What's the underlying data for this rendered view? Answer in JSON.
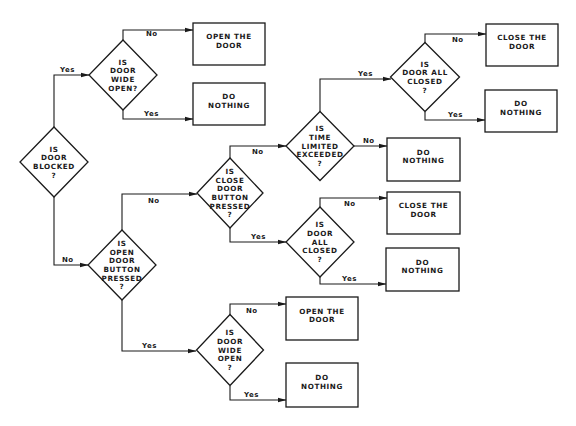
{
  "diagram": {
    "type": "flowchart",
    "colors": {
      "line": "#1a1a1a",
      "background": "#ffffff"
    },
    "nodes": [
      {
        "id": "d_blocked",
        "shape": "diamond",
        "cx": 54,
        "cy": 162,
        "w": 68,
        "h": 70,
        "lines": [
          "IS",
          "DOOR",
          "BLOCKED",
          "?"
        ]
      },
      {
        "id": "d_wide_open_1",
        "shape": "diamond",
        "cx": 123,
        "cy": 75,
        "w": 68,
        "h": 70,
        "lines": [
          "IS",
          "DOOR",
          "WIDE",
          "OPEN?"
        ]
      },
      {
        "id": "b_open_door_1",
        "shape": "box",
        "x": 193,
        "y": 23,
        "w": 72,
        "h": 42,
        "lines": [
          "OPEN THE",
          "DOOR"
        ]
      },
      {
        "id": "b_do_nothing_1",
        "shape": "box",
        "x": 193,
        "y": 83,
        "w": 72,
        "h": 42,
        "lines": [
          "DO",
          "NOTHING"
        ]
      },
      {
        "id": "d_open_button",
        "shape": "diamond",
        "cx": 122,
        "cy": 265,
        "w": 68,
        "h": 70,
        "lines": [
          "IS",
          "OPEN",
          "DOOR",
          "BUTTON",
          "PRESSED",
          "?"
        ]
      },
      {
        "id": "d_close_button",
        "shape": "diamond",
        "cx": 230,
        "cy": 193,
        "w": 66,
        "h": 70,
        "lines": [
          "IS",
          "CLOSE",
          "DOOR",
          "BUTTON",
          "PRESSED",
          "?"
        ]
      },
      {
        "id": "d_time_limit",
        "shape": "diamond",
        "cx": 320,
        "cy": 146,
        "w": 68,
        "h": 69,
        "lines": [
          "IS",
          "TIME",
          "LIMITED",
          "EXCEEDED",
          "?"
        ]
      },
      {
        "id": "d_all_closed_1",
        "shape": "diamond",
        "cx": 425,
        "cy": 77,
        "w": 69,
        "h": 69,
        "lines": [
          "IS",
          "DOOR ALL",
          "CLOSED",
          "?"
        ]
      },
      {
        "id": "b_close_door_1",
        "shape": "box",
        "x": 486,
        "y": 24,
        "w": 72,
        "h": 42,
        "lines": [
          "CLOSE THE",
          "DOOR"
        ]
      },
      {
        "id": "b_do_nothing_2",
        "shape": "box",
        "x": 485,
        "y": 90,
        "w": 72,
        "h": 42,
        "lines": [
          "DO",
          "NOTHING"
        ]
      },
      {
        "id": "b_do_nothing_3",
        "shape": "box",
        "x": 387,
        "y": 138,
        "w": 73,
        "h": 43,
        "lines": [
          "DO",
          "NOTHING"
        ]
      },
      {
        "id": "d_all_closed_2",
        "shape": "diamond",
        "cx": 320,
        "cy": 242,
        "w": 68,
        "h": 70,
        "lines": [
          "IS",
          "DOOR",
          "ALL",
          "CLOSED",
          "?"
        ]
      },
      {
        "id": "b_close_door_2",
        "shape": "box",
        "x": 387,
        "y": 192,
        "w": 73,
        "h": 42,
        "lines": [
          "CLOSE THE",
          "DOOR"
        ]
      },
      {
        "id": "b_do_nothing_4",
        "shape": "box",
        "x": 386,
        "y": 248,
        "w": 73,
        "h": 43,
        "lines": [
          "DO",
          "NOTHING"
        ]
      },
      {
        "id": "d_wide_open_2",
        "shape": "diamond",
        "cx": 230,
        "cy": 350,
        "w": 67,
        "h": 71,
        "lines": [
          "IS",
          "DOOR",
          "WIDE",
          "OPEN",
          "?"
        ]
      },
      {
        "id": "b_open_door_2",
        "shape": "box",
        "x": 286,
        "y": 297,
        "w": 72,
        "h": 43,
        "lines": [
          "OPEN THE",
          "DOOR"
        ]
      },
      {
        "id": "b_do_nothing_5",
        "shape": "box",
        "x": 286,
        "y": 363,
        "w": 72,
        "h": 44,
        "lines": [
          "DO",
          "NOTHING"
        ]
      }
    ],
    "edges": [
      {
        "from": "d_blocked",
        "to": "d_wide_open_1",
        "label": "Yes",
        "points": [
          [
            54,
            127
          ],
          [
            54,
            75
          ],
          [
            89,
            75
          ]
        ],
        "lx": 60,
        "ly": 72
      },
      {
        "from": "d_blocked",
        "to": "d_open_button",
        "label": "No",
        "points": [
          [
            54,
            197
          ],
          [
            54,
            265
          ],
          [
            88,
            265
          ]
        ],
        "lx": 62,
        "ly": 262
      },
      {
        "from": "d_wide_open_1",
        "to": "b_open_door_1",
        "label": "No",
        "points": [
          [
            123,
            40
          ],
          [
            123,
            30
          ],
          [
            193,
            30
          ]
        ],
        "lx": 146,
        "ly": 36
      },
      {
        "from": "d_wide_open_1",
        "to": "b_do_nothing_1",
        "label": "Yes",
        "points": [
          [
            123,
            110
          ],
          [
            123,
            119
          ],
          [
            193,
            119
          ]
        ],
        "lx": 144,
        "ly": 116
      },
      {
        "from": "d_open_button",
        "to": "d_close_button",
        "label": "No",
        "points": [
          [
            122,
            230
          ],
          [
            122,
            194
          ],
          [
            197,
            194
          ]
        ],
        "lx": 148,
        "ly": 203
      },
      {
        "from": "d_open_button",
        "to": "d_wide_open_2",
        "label": "Yes",
        "points": [
          [
            122,
            300
          ],
          [
            122,
            351
          ],
          [
            196,
            351
          ]
        ],
        "lx": 142,
        "ly": 348
      },
      {
        "from": "d_close_button",
        "to": "d_time_limit",
        "label": "No",
        "points": [
          [
            230,
            158
          ],
          [
            230,
            146
          ],
          [
            286,
            146
          ]
        ],
        "lx": 252,
        "ly": 154
      },
      {
        "from": "d_close_button",
        "to": "d_all_closed_2",
        "label": "Yes",
        "points": [
          [
            230,
            228
          ],
          [
            230,
            242
          ],
          [
            286,
            242
          ]
        ],
        "lx": 251,
        "ly": 239
      },
      {
        "from": "d_time_limit",
        "to": "d_all_closed_1",
        "label": "Yes",
        "points": [
          [
            320,
            112
          ],
          [
            320,
            79
          ],
          [
            391,
            79
          ]
        ],
        "lx": 358,
        "ly": 76
      },
      {
        "from": "d_time_limit",
        "to": "b_do_nothing_3",
        "label": "No",
        "points": [
          [
            354,
            146
          ],
          [
            387,
            146
          ]
        ],
        "lx": 363,
        "ly": 143
      },
      {
        "from": "d_all_closed_1",
        "to": "b_close_door_1",
        "label": "No",
        "points": [
          [
            425,
            43
          ],
          [
            425,
            34
          ],
          [
            486,
            34
          ]
        ],
        "lx": 452,
        "ly": 42
      },
      {
        "from": "d_all_closed_1",
        "to": "b_do_nothing_2",
        "label": "Yes",
        "points": [
          [
            425,
            112
          ],
          [
            425,
            120
          ],
          [
            485,
            120
          ]
        ],
        "lx": 448,
        "ly": 117
      },
      {
        "from": "d_all_closed_2",
        "to": "b_close_door_2",
        "label": "No",
        "points": [
          [
            320,
            207
          ],
          [
            320,
            198
          ],
          [
            387,
            198
          ]
        ],
        "lx": 344,
        "ly": 206
      },
      {
        "from": "d_all_closed_2",
        "to": "b_do_nothing_4",
        "label": "Yes",
        "points": [
          [
            320,
            277
          ],
          [
            320,
            284
          ],
          [
            386,
            284
          ]
        ],
        "lx": 342,
        "ly": 281
      },
      {
        "from": "d_wide_open_2",
        "to": "b_open_door_2",
        "label": "No",
        "points": [
          [
            230,
            315
          ],
          [
            230,
            304
          ],
          [
            286,
            304
          ]
        ],
        "lx": 246,
        "ly": 313
      },
      {
        "from": "d_wide_open_2",
        "to": "b_do_nothing_5",
        "label": "Yes",
        "points": [
          [
            230,
            386
          ],
          [
            230,
            400
          ],
          [
            286,
            400
          ]
        ],
        "lx": 244,
        "ly": 397
      }
    ]
  }
}
